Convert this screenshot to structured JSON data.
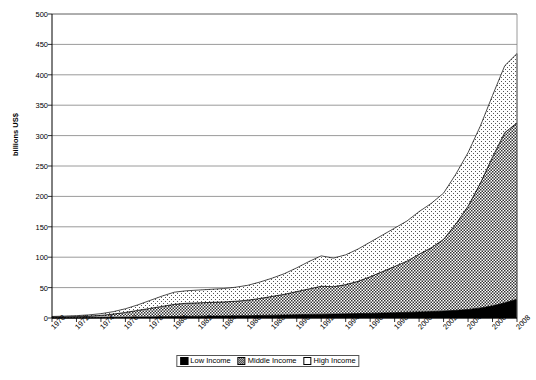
{
  "chart": {
    "type": "area",
    "ylabel": "billions US$",
    "xlabel": "",
    "title": ""
  },
  "axes": {
    "y_ticks": [
      "0",
      "50",
      "100",
      "150",
      "200",
      "250",
      "300",
      "350",
      "400",
      "450",
      "500"
    ],
    "y_min": 0,
    "y_max": 500,
    "y_step": 50,
    "x_ticks": [
      "1970",
      "1972",
      "1974",
      "1976",
      "1978",
      "1980",
      "1982",
      "1984",
      "1986",
      "1988",
      "1990",
      "1992",
      "1994",
      "1996",
      "1998",
      "2000",
      "2002",
      "2004",
      "2006",
      "2008"
    ]
  },
  "legend": {
    "position": "bottom-center",
    "items": [
      {
        "label": "Low Income",
        "swatch": "solid-black",
        "color": "#000000"
      },
      {
        "label": "Middle Income",
        "swatch": "checker-hatch",
        "color": "#6b6b6b"
      },
      {
        "label": "High Income",
        "swatch": "white-dotted",
        "color": "#ffffff"
      }
    ]
  },
  "chart_data": {
    "type": "area",
    "stacked": true,
    "title": "",
    "xlabel": "",
    "ylabel": "billions US$",
    "ylim": [
      0,
      500
    ],
    "grid": true,
    "legend_position": "bottom-center",
    "x": [
      1970,
      1971,
      1972,
      1973,
      1974,
      1975,
      1976,
      1977,
      1978,
      1979,
      1980,
      1981,
      1982,
      1983,
      1984,
      1985,
      1986,
      1987,
      1988,
      1989,
      1990,
      1991,
      1992,
      1993,
      1994,
      1995,
      1996,
      1997,
      1998,
      1999,
      2000,
      2001,
      2002,
      2003,
      2004,
      2005,
      2006,
      2007,
      2008
    ],
    "series": [
      {
        "name": "Low Income",
        "values": [
          0.2,
          0.3,
          0.4,
          0.5,
          0.7,
          0.9,
          1.2,
          1.5,
          1.8,
          2.1,
          2.5,
          2.8,
          3.0,
          3.2,
          3.4,
          3.6,
          3.8,
          4.2,
          4.6,
          5.0,
          5.5,
          5.9,
          6.2,
          6.5,
          6.9,
          7.3,
          7.8,
          8.3,
          8.8,
          9.4,
          10.0,
          10.6,
          11.4,
          12.6,
          14.0,
          16.5,
          20.0,
          25.0,
          31.0
        ]
      },
      {
        "name": "Middle Income",
        "values": [
          1.3,
          1.6,
          2.0,
          2.6,
          3.6,
          5.5,
          8.0,
          11.0,
          14.0,
          17.0,
          20.0,
          21.5,
          22.0,
          22.5,
          23.0,
          24.0,
          25.5,
          28.0,
          31.0,
          34.0,
          38.0,
          42.0,
          46.0,
          45.0,
          48.0,
          53.0,
          60.0,
          68.0,
          76.0,
          84.0,
          95.0,
          105.0,
          118.0,
          142.0,
          170.0,
          205.0,
          245.0,
          280.0,
          290.0
        ]
      },
      {
        "name": "High Income",
        "values": [
          1.0,
          1.2,
          1.5,
          2.0,
          2.8,
          4.0,
          6.0,
          9.0,
          13.0,
          17.0,
          20.0,
          20.5,
          21.0,
          21.5,
          22.0,
          23.0,
          24.5,
          27.0,
          30.0,
          34.0,
          39.0,
          45.0,
          50.0,
          47.0,
          49.0,
          53.0,
          57.0,
          60.0,
          63.0,
          66.0,
          70.0,
          73.0,
          76.0,
          82.0,
          88.0,
          94.0,
          101.0,
          110.0,
          114.0
        ]
      }
    ],
    "totals": [
      2.5,
      3.1,
      3.9,
      5.1,
      7.1,
      10.4,
      15.2,
      21.5,
      28.8,
      36.1,
      42.5,
      44.8,
      46.0,
      47.2,
      48.4,
      50.6,
      53.8,
      59.2,
      65.6,
      73.0,
      82.5,
      92.9,
      102.2,
      98.5,
      103.9,
      113.3,
      124.8,
      136.3,
      147.8,
      159.4,
      175.0,
      188.6,
      205.4,
      236.6,
      272.0,
      315.5,
      366.0,
      415.0,
      435.0
    ]
  }
}
